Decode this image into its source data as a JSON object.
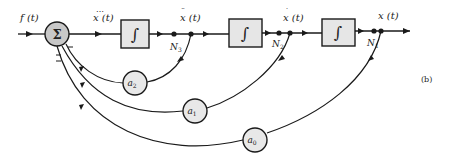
{
  "diagram": {
    "type": "block-diagram",
    "figure_label": "(b)",
    "input": {
      "label": "f(t)"
    },
    "summing_junction": {
      "symbol": "Σ",
      "signs": [
        "+",
        "−",
        "−",
        "−"
      ]
    },
    "signals": [
      {
        "id": "xddd",
        "label": "x⃛(t)",
        "text": "x (t)",
        "dots": "⋯"
      },
      {
        "id": "xdd",
        "label": "ẍ(t)",
        "text": "x (t)",
        "dots": "¨"
      },
      {
        "id": "xd",
        "label": "ẋ(t)",
        "text": "x (t)",
        "dots": "˙"
      },
      {
        "id": "x",
        "label": "x(t)",
        "text": "x (t)",
        "dots": ""
      }
    ],
    "integrators": [
      {
        "symbol": "∫"
      },
      {
        "symbol": "∫"
      },
      {
        "symbol": "∫"
      }
    ],
    "nodes": [
      "N3",
      "N2",
      "N1"
    ],
    "node_labels": {
      "n3": "N",
      "n3_sub": "3",
      "n2": "N",
      "n2_sub": "2",
      "n1": "N",
      "n1_sub": "1"
    },
    "gains": [
      {
        "name": "a2",
        "base": "a",
        "sub": "2"
      },
      {
        "name": "a1",
        "base": "a",
        "sub": "1"
      },
      {
        "name": "a0",
        "base": "a",
        "sub": "0"
      }
    ],
    "colors": {
      "line": "#1a1a1a",
      "block_fill": "#e6e6e6",
      "sum_fill": "#c8c8c8",
      "gain_fill": "#e8e8e8"
    }
  }
}
